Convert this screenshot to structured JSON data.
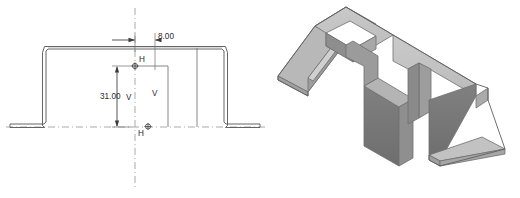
{
  "figure": {
    "kind": "cad-sheet-metal-figure",
    "panes": [
      {
        "id": "sketch",
        "label": "2d-profile-sketch"
      },
      {
        "id": "model",
        "label": "3d-isometric-solid"
      }
    ]
  },
  "sketch": {
    "title": "hat-section-profile",
    "dimensions": [
      {
        "name": "width-offset-dimension",
        "value": "8.00",
        "orientation": "horizontal",
        "units": "mm"
      },
      {
        "name": "height-dimension",
        "value": "31.00",
        "orientation": "vertical",
        "units": "mm"
      }
    ],
    "constraints": [
      {
        "name": "horizontal-constraint-upper",
        "symbol": "H"
      },
      {
        "name": "horizontal-constraint-lower",
        "symbol": "H"
      },
      {
        "name": "vertical-constraint-left",
        "symbol": "V"
      },
      {
        "name": "vertical-constraint-right",
        "symbol": "V"
      }
    ],
    "centerlines": [
      {
        "name": "vertical-centerline",
        "style": "dash-dot"
      },
      {
        "name": "horizontal-centerline",
        "style": "dash-dot"
      }
    ]
  },
  "model": {
    "title": "hat-channel-with-notch",
    "faces": [
      {
        "name": "top-face",
        "shade": "#c3c3c3"
      },
      {
        "name": "upper-top-face",
        "shade": "#bdbdbd"
      },
      {
        "name": "front-wall-face",
        "shade": "#767676"
      },
      {
        "name": "side-wall-face",
        "shade": "#9a9a9a"
      },
      {
        "name": "left-flange-face",
        "shade": "#b6b6b6"
      },
      {
        "name": "right-flange-face",
        "shade": "#c0c0c0"
      },
      {
        "name": "notch-inner-face",
        "shade": "#8c8c8c"
      },
      {
        "name": "edge-thickness-face",
        "shade": "#d2d2d2"
      }
    ]
  },
  "colors": {
    "background": "#ffffff",
    "sketch_line": "#5a5a5a",
    "sketch_line_dark": "#3d3d3d",
    "centerline": "#9a9a9a",
    "dimension_line": "#3a3a3a",
    "text": "#2b2b2b",
    "model_outline": "#6e6e6e"
  }
}
